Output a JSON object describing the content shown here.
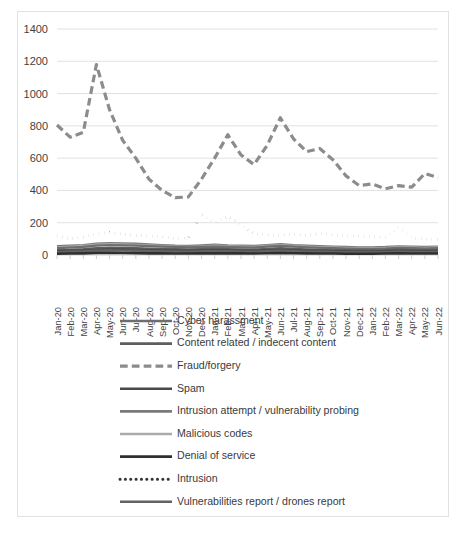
{
  "figure": {
    "background_color": "#ffffff",
    "border_color": "#e2e2e4"
  },
  "chart_data": {
    "type": "line",
    "title": "",
    "subtitle": "",
    "xlabel": "",
    "ylabel": "",
    "ylim": [
      0,
      1400
    ],
    "ytick_values": [
      0,
      200,
      400,
      600,
      800,
      1000,
      1200,
      1400
    ],
    "ytick_labels": [
      "0",
      "200",
      "400",
      "600",
      "800",
      "1000",
      "1200",
      "1400"
    ],
    "grid": true,
    "grid_axis": "y",
    "legend_position": "bottom",
    "categories": [
      "Jan-20",
      "Feb-20",
      "Mar-20",
      "Apr-20",
      "May-20",
      "Jun-20",
      "Jul-20",
      "Aug-20",
      "Sep-20",
      "Oct-20",
      "Nov-20",
      "Dec-20",
      "Jan-21",
      "Feb-21",
      "Mar-21",
      "Apr-21",
      "May-21",
      "Jun-21",
      "Jul-21",
      "Aug-21",
      "Sep-21",
      "Oct-21",
      "Nov-21",
      "Dec-21",
      "Jan-22",
      "Feb-22",
      "Mar-22",
      "Apr-22",
      "May-22",
      "Jun-22"
    ],
    "series": [
      {
        "name": "Cyber harassment",
        "color": "#6e6e6e",
        "dash": "none",
        "width": 2.2,
        "values": [
          42,
          46,
          50,
          58,
          62,
          60,
          58,
          55,
          52,
          50,
          48,
          50,
          52,
          50,
          48,
          46,
          52,
          56,
          52,
          48,
          45,
          42,
          40,
          38,
          38,
          40,
          44,
          42,
          40,
          42
        ]
      },
      {
        "name": "Content  related / indecent content",
        "color": "#5d5d5d",
        "dash": "none",
        "width": 2.2,
        "values": [
          30,
          32,
          36,
          42,
          46,
          44,
          42,
          40,
          38,
          36,
          35,
          36,
          38,
          36,
          35,
          34,
          38,
          42,
          38,
          35,
          33,
          31,
          30,
          28,
          28,
          30,
          33,
          31,
          30,
          31
        ]
      },
      {
        "name": "Fraud/forgery",
        "color": "#8c8c8c",
        "dash": "dashed",
        "width": 3.2,
        "values": [
          805,
          730,
          760,
          1180,
          900,
          710,
          600,
          470,
          400,
          355,
          360,
          470,
          600,
          745,
          620,
          560,
          680,
          850,
          720,
          640,
          660,
          590,
          490,
          430,
          440,
          410,
          430,
          420,
          505,
          480
        ]
      },
      {
        "name": "Spam",
        "color": "#4a4a4a",
        "dash": "none",
        "width": 2.4,
        "values": [
          24,
          26,
          28,
          32,
          35,
          34,
          32,
          30,
          28,
          27,
          26,
          28,
          30,
          28,
          27,
          26,
          29,
          32,
          29,
          27,
          26,
          24,
          23,
          22,
          22,
          24,
          26,
          25,
          24,
          25
        ]
      },
      {
        "name": "Intrusion attempt / vulnerability probing",
        "color": "#7a7a7a",
        "dash": "none",
        "width": 2.2,
        "values": [
          55,
          58,
          62,
          70,
          74,
          72,
          70,
          66,
          62,
          58,
          56,
          60,
          64,
          60,
          58,
          56,
          62,
          68,
          62,
          58,
          55,
          52,
          50,
          48,
          48,
          50,
          54,
          52,
          50,
          52
        ]
      },
      {
        "name": "Malicious codes",
        "color": "#aaaaaa",
        "dash": "none",
        "width": 2.2,
        "values": [
          48,
          52,
          56,
          64,
          68,
          66,
          63,
          60,
          56,
          53,
          51,
          54,
          58,
          55,
          52,
          50,
          56,
          62,
          56,
          52,
          49,
          47,
          45,
          43,
          43,
          45,
          49,
          47,
          45,
          47
        ]
      },
      {
        "name": "Denial of service",
        "color": "#2f2f2f",
        "dash": "none",
        "width": 2.6,
        "values": [
          8,
          9,
          10,
          12,
          13,
          12,
          11,
          10,
          10,
          9,
          9,
          10,
          11,
          10,
          10,
          9,
          11,
          12,
          11,
          10,
          9,
          9,
          8,
          8,
          8,
          9,
          10,
          9,
          9,
          9
        ]
      },
      {
        "name": "Intrusion",
        "color": "#333333",
        "dash": "dotted",
        "width": 3.0,
        "values": [
          120,
          100,
          112,
          130,
          140,
          128,
          122,
          118,
          112,
          100,
          105,
          250,
          200,
          240,
          190,
          130,
          125,
          122,
          128,
          120,
          135,
          125,
          120,
          118,
          112,
          110,
          170,
          105,
          100,
          95
        ]
      },
      {
        "name": "Vulnerabilities report / drones report",
        "color": "#636363",
        "dash": "none",
        "width": 2.4,
        "values": [
          18,
          20,
          22,
          26,
          28,
          27,
          26,
          24,
          22,
          21,
          20,
          22,
          24,
          22,
          21,
          20,
          23,
          26,
          23,
          21,
          20,
          19,
          18,
          17,
          17,
          18,
          20,
          19,
          18,
          19
        ]
      }
    ]
  }
}
